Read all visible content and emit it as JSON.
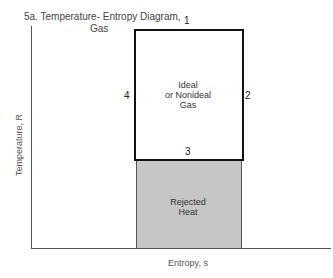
{
  "title": {
    "line1": "5a.  Temperature- Entropy  Diagram,",
    "line2": "Gas"
  },
  "axes": {
    "x_label": "Entropy, s",
    "y_label": "Temperature, R"
  },
  "cycle": {
    "points": [
      "1",
      "2",
      "3",
      "4"
    ],
    "label_line1": "Ideal",
    "label_line2": "or Nonideal",
    "label_line3": "Gas"
  },
  "rejected": {
    "label_line1": "Rejected",
    "label_line2": "Heat",
    "fill_color": "#c6c6c6"
  }
}
